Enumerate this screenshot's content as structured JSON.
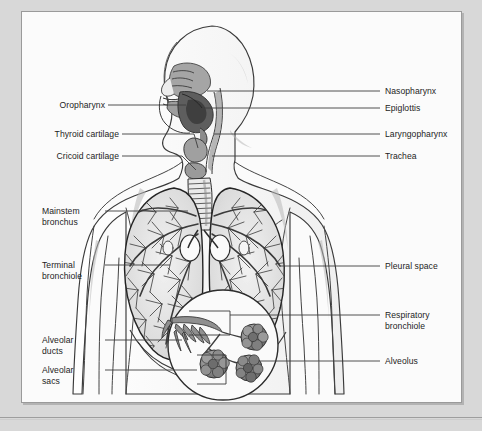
{
  "page": {
    "background_color": "#d8d8d8",
    "panel_background_color": "#fbfbfb",
    "panel_border_color": "#9a9a9a",
    "ghost_text": "SYSTEM"
  },
  "figure": {
    "type": "anatomical-illustration",
    "ink_color": "#2b2b2b",
    "shading_color": "#8f8f8f"
  },
  "labels": {
    "left": [
      {
        "id": "oropharynx",
        "text": "Oropharynx",
        "lines": [
          "Oropharynx"
        ]
      },
      {
        "id": "thyroid-cartilage",
        "text": "Thyroid cartilage",
        "lines": [
          "Thyroid cartilage"
        ]
      },
      {
        "id": "cricoid-cartilage",
        "text": "Cricoid cartilage",
        "lines": [
          "Cricoid cartilage"
        ]
      },
      {
        "id": "mainstem-bronchus",
        "text": "Mainstem bronchus",
        "lines": [
          "Mainstem",
          "bronchus"
        ]
      },
      {
        "id": "terminal-bronchiole",
        "text": "Terminal bronchiole",
        "lines": [
          "Terminal",
          "bronchiole"
        ]
      },
      {
        "id": "alveolar-ducts",
        "text": "Alveolar ducts",
        "lines": [
          "Alveolar",
          "ducts"
        ]
      },
      {
        "id": "alveolar-sacs",
        "text": "Alveolar sacs",
        "lines": [
          "Alveolar",
          "sacs"
        ]
      }
    ],
    "right": [
      {
        "id": "nasopharynx",
        "text": "Nasopharynx",
        "lines": [
          "Nasopharynx"
        ]
      },
      {
        "id": "epiglottis",
        "text": "Epiglottis",
        "lines": [
          "Epiglottis"
        ]
      },
      {
        "id": "laryngopharynx",
        "text": "Laryngopharynx",
        "lines": [
          "Laryngopharynx"
        ]
      },
      {
        "id": "trachea",
        "text": "Trachea",
        "lines": [
          "Trachea"
        ]
      },
      {
        "id": "pleural-space",
        "text": "Pleural space",
        "lines": [
          "Pleural space"
        ]
      },
      {
        "id": "respiratory-bronchiole",
        "text": "Respiratory bronchiole",
        "lines": [
          "Respiratory",
          "bronchiole"
        ]
      },
      {
        "id": "alveolus",
        "text": "Alveolus",
        "lines": [
          "Alveolus"
        ]
      }
    ]
  },
  "text": {
    "oropharynx": "Oropharynx",
    "thyroid_cartilage": "Thyroid cartilage",
    "cricoid_cartilage": "Cricoid cartilage",
    "mainstem_1": "Mainstem",
    "mainstem_2": "bronchus",
    "terminal_1": "Terminal",
    "terminal_2": "bronchiole",
    "alveolar_ducts_1": "Alveolar",
    "alveolar_ducts_2": "ducts",
    "alveolar_sacs_1": "Alveolar",
    "alveolar_sacs_2": "sacs",
    "nasopharynx": "Nasopharynx",
    "epiglottis": "Epiglottis",
    "laryngopharynx": "Laryngopharynx",
    "trachea": "Trachea",
    "pleural_space": "Pleural space",
    "respiratory_1": "Respiratory",
    "respiratory_2": "bronchiole",
    "alveolus": "Alveolus",
    "ghost": "SYSTEM"
  }
}
